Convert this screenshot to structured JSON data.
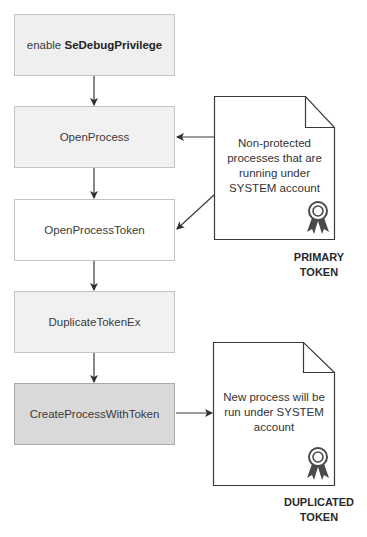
{
  "diagram": {
    "steps": [
      {
        "prefix": "enable ",
        "label": "SeDebugPrivilege",
        "fill": "#efefef"
      },
      {
        "label": "OpenProcess",
        "fill": "#f1f1f1"
      },
      {
        "label": "OpenProcessToken",
        "fill": "#ffffff"
      },
      {
        "label": "DuplicateTokenEx",
        "fill": "#f1f1f1"
      },
      {
        "label": "CreateProcessWithToken",
        "fill": "#d9d9d9"
      }
    ],
    "notes": [
      {
        "lines": [
          "Non-protected",
          "processes that are",
          "running under",
          "SYSTEM account"
        ],
        "icon": "award-ribbon-icon",
        "caption": [
          "PRIMARY",
          "TOKEN"
        ]
      },
      {
        "lines": [
          "New process will be",
          "run under SYSTEM",
          "account"
        ],
        "icon": "award-ribbon-icon",
        "caption": [
          "DUPLICATED",
          "TOKEN"
        ]
      }
    ],
    "colors": {
      "stroke": "#3a3a3a",
      "box_border": "#c4c4c4",
      "ribbon": "#4a4a4a"
    }
  }
}
